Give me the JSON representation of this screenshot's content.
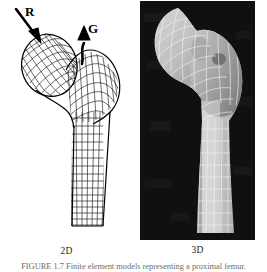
{
  "figure": {
    "id": "FIGURE 1.7",
    "caption_text": "FIGURE 1.7  Finite element models representing a proximal femur.",
    "background_color": "#ffffff"
  },
  "panels": [
    {
      "key": "2d",
      "caption": "2D",
      "kind": "wireframe-mesh",
      "background_color": "#ffffff",
      "line_color": "#000000",
      "subject": "proximal femur",
      "annotations": [
        {
          "name": "R",
          "label": "R",
          "meaning": "joint reaction force",
          "arrow_direction": "down-right",
          "target": "femoral head"
        },
        {
          "name": "G",
          "label": "G",
          "meaning": "abductor muscle force",
          "arrow_direction": "up",
          "target": "greater trochanter"
        }
      ]
    },
    {
      "key": "3d",
      "caption": "3D",
      "kind": "shaded-surface-mesh",
      "background_color": "#121212",
      "surface_color": "#b9b9b9",
      "mesh_line_color": "#f0f0f0",
      "subject": "proximal femur"
    }
  ],
  "colors": {
    "page_background": "#ffffff",
    "ink": "#000000",
    "panel_3d_background": "#121212",
    "bone_light": "#cfcfcf",
    "bone_mid": "#a8a8a8",
    "bone_dark": "#787878",
    "caption_gray": "#6d6d6d"
  }
}
